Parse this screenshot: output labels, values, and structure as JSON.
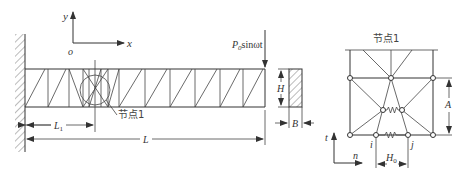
{
  "figure": {
    "type": "structural-diagram",
    "left_panel": {
      "axes": {
        "y_label": "y",
        "x_label": "x",
        "origin_label": "o"
      },
      "load_label": "P",
      "load_subscript": "0",
      "load_suffix": "sinωt",
      "node_callout": "节点1",
      "dimensions": {
        "L1_main": "L",
        "L1_sub": "1",
        "L": "L"
      }
    },
    "cross_section": {
      "height_label": "H",
      "width_label": "B"
    },
    "right_panel": {
      "title": "节点1",
      "dimension_A": "A",
      "dimension_H0_main": "H",
      "dimension_H0_sub": "0",
      "node_i": "i",
      "node_j": "j",
      "axis_t": "t",
      "axis_n": "n"
    }
  }
}
